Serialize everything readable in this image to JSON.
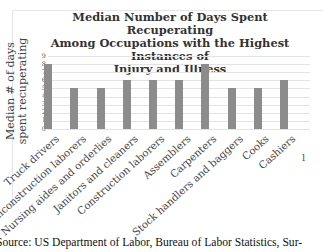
{
  "chart_data": {
    "type": "bar",
    "title": "Median Number of Days Spent Recuperating Among Occupations with the Highest Instances of Injury and Illness",
    "title_lines": [
      "Median Number of Days Spent Recuperating",
      "Among Occupations with the Highest Instances of",
      "Injury and Illness"
    ],
    "xlabel": "",
    "ylabel": "Median # of days spent recuperating",
    "ylim": [
      0,
      9
    ],
    "yticks": [
      "0",
      "1",
      "2",
      "3",
      "4",
      "5",
      "6",
      "7",
      "8",
      "9"
    ],
    "grid": true,
    "legend": null,
    "categories": [
      "Truck drivers",
      "Nonconstruction laborers",
      "Nursing aides and orderlies",
      "Janitors and cleaners",
      "Construction laborers",
      "Assemblers",
      "Carpenters",
      "Stock handlers and baggers",
      "Cooks",
      "Cashiers"
    ],
    "values": [
      8,
      5,
      5,
      6,
      6,
      6,
      8,
      5,
      5,
      6
    ],
    "bar_color": "#8c8c8c"
  },
  "source_text": "Source: US Department of Labor, Bureau of Labor Statistics, Sur-",
  "axis_fragment": "l"
}
